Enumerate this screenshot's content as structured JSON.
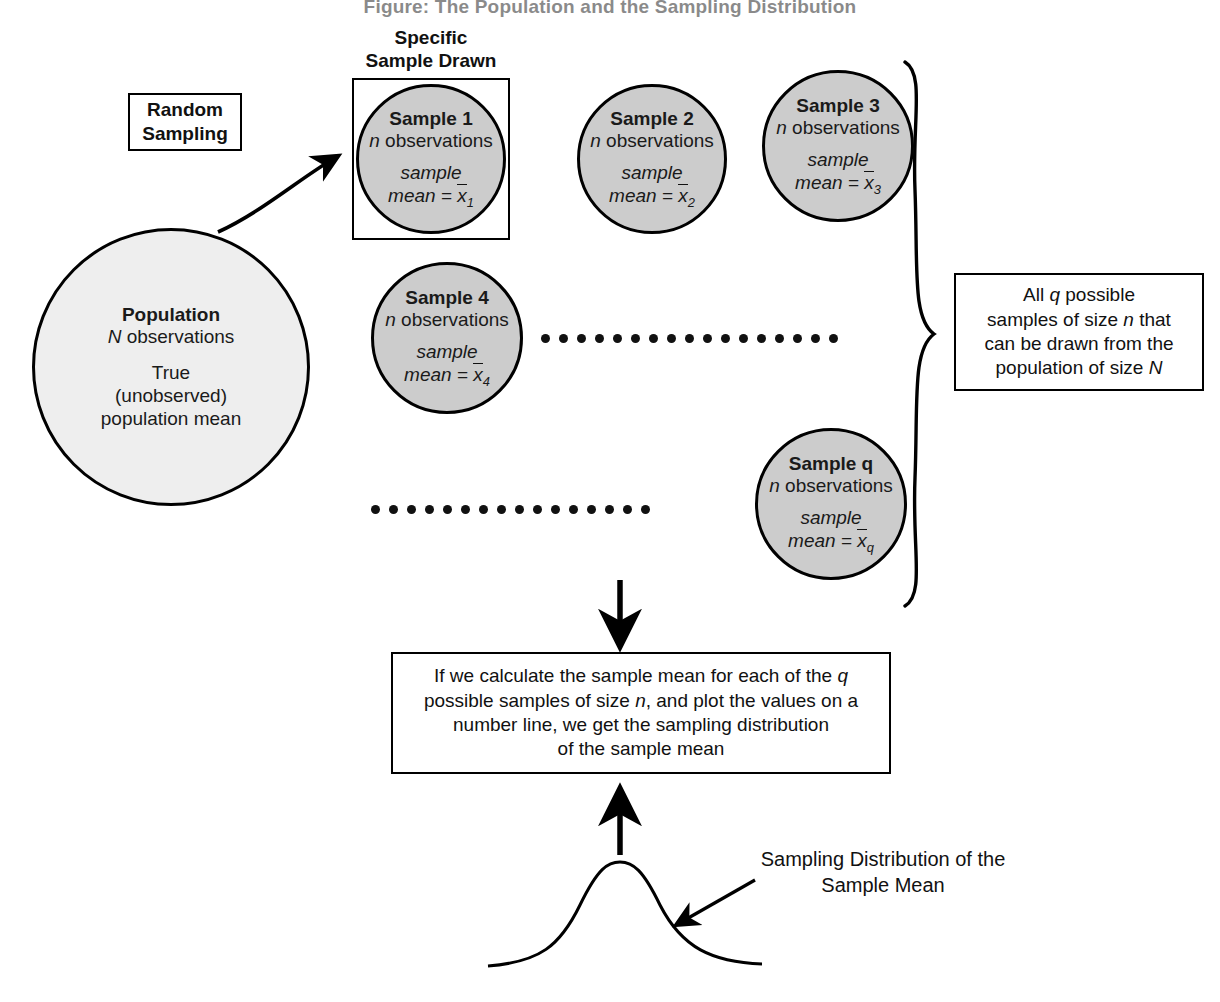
{
  "title": "Figure: The Population and the Sampling Distribution",
  "captions": {
    "specific_sample": "Specific\nSample Drawn"
  },
  "specific_sample_caption_line1": "Specific",
  "specific_sample_caption_line2": "Sample Drawn",
  "random_sampling_box": {
    "line1": "Random",
    "line2": "Sampling"
  },
  "population": {
    "title": "Population",
    "observations_symbol": "N",
    "observations_text": " observations",
    "line_true": "True",
    "line_unobserved": "(unobserved)",
    "line_mean": "population mean"
  },
  "samples": [
    {
      "title": "Sample 1",
      "n_symbol": "n",
      "observations": " observations",
      "sample_word": "sample",
      "mean_prefix": "mean = ",
      "mean_var": "x",
      "mean_sub": "1"
    },
    {
      "title": "Sample 2",
      "n_symbol": "n",
      "observations": " observations",
      "sample_word": "sample",
      "mean_prefix": "mean = ",
      "mean_var": "x",
      "mean_sub": "2"
    },
    {
      "title": "Sample 3",
      "n_symbol": "n",
      "observations": " observations",
      "sample_word": "sample",
      "mean_prefix": "mean = ",
      "mean_var": "x",
      "mean_sub": "3"
    },
    {
      "title": "Sample 4",
      "n_symbol": "n",
      "observations": " observations",
      "sample_word": "sample",
      "mean_prefix": "mean = ",
      "mean_var": "x",
      "mean_sub": "4"
    },
    {
      "title": "Sample q",
      "n_symbol": "n",
      "observations": " observations",
      "sample_word": "sample",
      "mean_prefix": "mean = ",
      "mean_var": "x",
      "mean_sub": "q"
    }
  ],
  "brace_box": {
    "l1a": "All ",
    "l1b": "q",
    "l1c": " possible",
    "l2a": "samples of size ",
    "l2b": "n",
    "l2c": " that",
    "l3": "can be drawn from the",
    "l4a": "population of size ",
    "l4b": "N"
  },
  "result_box": {
    "l1a": "If we calculate the sample mean for each of the ",
    "l1b": "q",
    "l2a": "possible samples of size ",
    "l2b": "n",
    "l2c": ", and plot the values on a",
    "l3": "number line, we get the sampling distribution",
    "l4": "of the sample mean"
  },
  "distribution_label": {
    "line1": "Sampling Distribution of the",
    "line2": "Sample Mean"
  },
  "dots_rows": {
    "top_count": 17,
    "bottom_count": 16
  },
  "colors": {
    "stroke": "#000000",
    "population_fill": "#eeeeee",
    "sample_fill": "#cccccc",
    "text": "#111111",
    "background": "#ffffff"
  }
}
